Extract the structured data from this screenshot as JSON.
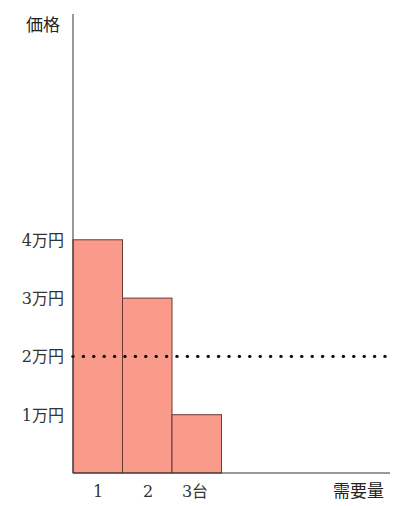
{
  "chart_data": {
    "type": "bar",
    "title": "",
    "xlabel": "需要量",
    "ylabel": "価格",
    "categories": [
      "1",
      "2",
      "3台"
    ],
    "values": [
      4,
      3,
      1
    ],
    "unit": "万円",
    "yticks": [
      "1万円",
      "2万円",
      "3万円",
      "4万円"
    ],
    "ytick_values": [
      1,
      2,
      3,
      4
    ],
    "ylim": [
      0,
      7.4
    ],
    "grid": false,
    "legend": null,
    "reference_line": {
      "value": 2,
      "label": "2万円",
      "style": "dotted"
    },
    "bar_color": "#f99a8a",
    "bar_edge_color": "#6b3a32"
  }
}
